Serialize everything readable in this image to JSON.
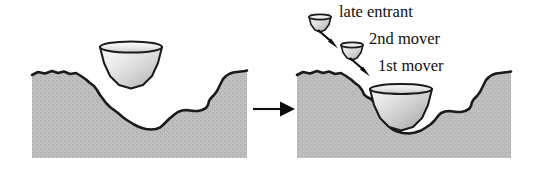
{
  "figure": {
    "title": "",
    "width": 534,
    "height": 174,
    "background": "#ffffff"
  },
  "colors": {
    "terrain_fill": "#bcbcbc",
    "terrain_texture": "#ababab",
    "terrain_outline": "#1a1a1a",
    "bowl_light": "#f4f4f4",
    "bowl_mid": "#d8d8d8",
    "bowl_dark": "#a8a8a8",
    "bowl_outline": "#1a1a1a",
    "text": "#101010",
    "arrow": "#0d0d0d",
    "void": "#ffffff"
  },
  "panels": [
    {
      "id": "before",
      "name": "left-panel",
      "caption": "",
      "terrain_name": "rugged-landscape",
      "bowls": [
        {
          "id": "unsettled-firm",
          "label": "",
          "size": "large",
          "state": "above-landscape"
        }
      ]
    },
    {
      "id": "after",
      "name": "right-panel",
      "caption": "",
      "terrain_name": "rugged-landscape",
      "bowls": [
        {
          "id": "first-mover",
          "label": "1st mover",
          "size": "large",
          "state": "settled-in-valley"
        },
        {
          "id": "second-mover",
          "label": "2nd mover",
          "size": "small",
          "state": "descending"
        },
        {
          "id": "late-entrant",
          "label": "late entrant",
          "size": "small",
          "state": "descending"
        }
      ]
    }
  ],
  "labels": {
    "late_entrant": "late entrant",
    "second_mover": "2nd mover",
    "first_mover": "1st mover"
  },
  "arrows": {
    "transition": {
      "name": "transition-arrow",
      "direction": "right"
    },
    "late_entrant_descent": {
      "name": "late-entrant-arrow",
      "direction": "down-right"
    },
    "second_mover_descent": {
      "name": "second-mover-arrow",
      "direction": "down-right"
    }
  }
}
